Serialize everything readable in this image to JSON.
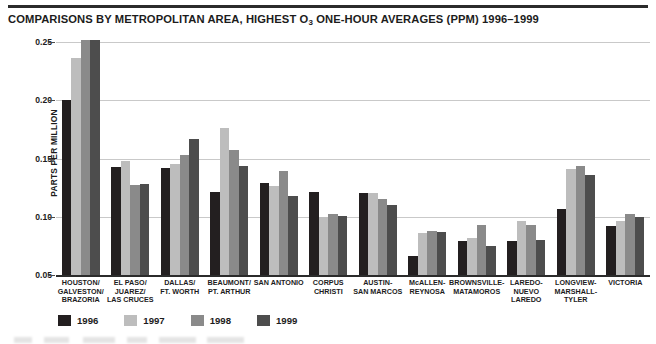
{
  "chart_data": {
    "type": "bar",
    "title_main": "COMPARISONS BY METROPOLITAN AREA, HIGHEST O",
    "title_sub": "3",
    "title_tail": " ONE-HOUR AVERAGES (PPM) 1996–1999",
    "xlabel": "",
    "ylabel": "PARTS PER MILLION",
    "ylim": [
      0.05,
      0.25
    ],
    "ytick_labels": [
      "0.25",
      "0.20",
      "0.15",
      "0.10",
      "0.05"
    ],
    "ytick_values": [
      0.25,
      0.2,
      0.15,
      0.1,
      0.05
    ],
    "grid": true,
    "legend_position": "bottom-left",
    "categories": [
      "HOUSTON/\nGALVESTON/\nBRAZORIA",
      "EL PASO/\nJUAREZ/\nLAS CRUCES",
      "DALLAS/\nFT. WORTH",
      "BEAUMONT/\nPT. ARTHUR",
      "SAN ANTONIO",
      "CORPUS\nCHRISTI",
      "AUSTIN-\nSAN MARCOS",
      "McALLEN-\nREYNOSA",
      "BROWNSVILLE-\nMATAMOROS",
      "LAREDO-\nNUEVO LAREDO",
      "LONGVIEW-\nMARSHALL-\nTYLER",
      "VICTORIA"
    ],
    "series": [
      {
        "name": "1996",
        "color": "#231f20",
        "values": [
          0.2,
          0.143,
          0.142,
          0.121,
          0.129,
          0.121,
          0.12,
          0.066,
          0.079,
          0.079,
          0.107,
          0.092
        ]
      },
      {
        "name": "1997",
        "color": "#bdbdbd",
        "values": [
          0.236,
          0.148,
          0.145,
          0.176,
          0.126,
          0.1,
          0.12,
          0.086,
          0.082,
          0.096,
          0.141,
          0.096
        ]
      },
      {
        "name": "1998",
        "color": "#8a8a8a",
        "values": [
          0.252,
          0.127,
          0.153,
          0.157,
          0.139,
          0.102,
          0.115,
          0.088,
          0.093,
          0.093,
          0.144,
          0.102
        ]
      },
      {
        "name": "1999",
        "color": "#4d4d4d",
        "values": [
          0.252,
          0.128,
          0.167,
          0.144,
          0.118,
          0.101,
          0.11,
          0.087,
          0.075,
          0.08,
          0.136,
          0.1
        ]
      }
    ]
  },
  "legend": {
    "items": [
      {
        "label": "1996",
        "color": "#231f20"
      },
      {
        "label": "1997",
        "color": "#bdbdbd"
      },
      {
        "label": "1998",
        "color": "#8a8a8a"
      },
      {
        "label": "1999",
        "color": "#4d4d4d"
      }
    ]
  },
  "colors": {
    "background": "#ffffff",
    "rule": "#2b2b2b",
    "gridline": "#c9c9c9",
    "text": "#1c1c1c"
  }
}
